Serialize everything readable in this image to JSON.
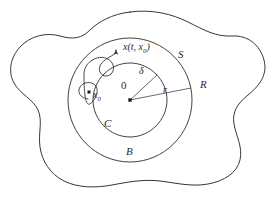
{
  "figure": {
    "background_color": "#ffffff",
    "stroke_color": "#2b2b2b",
    "line_width": 0.9
  },
  "labels": {
    "region_outer": "R",
    "circle_outer": "S",
    "annulus": "B",
    "circle_inner": "C",
    "radius_outer": "r",
    "radius_inner": "δ",
    "origin": "0",
    "initial_point": "x",
    "initial_point_sub": "0",
    "trajectory_prefix": "x(t, x",
    "trajectory_sub": "0",
    "trajectory_suffix": ")"
  },
  "geometry": {
    "center": {
      "x": 130,
      "y": 100
    },
    "inner_radius": 37,
    "outer_radius": 62,
    "origin_marker": {
      "x": 130,
      "y": 100,
      "size": 3.4
    },
    "initial_marker": {
      "x": 89,
      "y": 92,
      "size": 3.0
    },
    "delta_line": {
      "x1": 130,
      "y1": 100,
      "x2": 157,
      "y2": 75
    },
    "r_line": {
      "x1": 130,
      "y1": 100,
      "x2": 191,
      "y2": 88
    },
    "arrow_tip": {
      "x": 116,
      "y": 48
    }
  },
  "paths": {
    "region_boundary": "M 130 12 C 152 9 172 14 188 22 C 204 30 216 37 232 36 C 248 35 260 45 264 60 C 268 75 259 86 248 95 C 237 104 232 112 234 124 C 236 136 243 147 240 160 C 237 173 224 181 208 184 C 192 187 176 183 160 181 C 144 179 128 182 112 185 C 96 188 78 188 64 181 C 50 174 42 161 40 147 C 38 133 43 121 38 110 C 33 99 20 94 14 83 C 8 72 10 58 20 47 C 30 36 46 32 60 36 C 74 40 82 38 90 30 C 98 22 112 14 130 12 Z",
    "outer_circle": "M 130 38 C 164 38 192 66 192 100 C 192 134 164 162 130 162 C 96 162 68 134 68 100 C 68 66 96 38 130 38 Z",
    "inner_circle": "M 130 63 C 150 63 167 80 167 100 C 167 120 150 137 130 137 C 110 137 93 120 93 100 C 93 80 110 63 130 63 Z",
    "trajectory": "M 88 99 C 80 98 77 92 80 87 C 83 82 91 81 95 85 C 99 89 97 96 93 101 C 89 106 84 110 84 74 C 84 66 90 60 97 58 C 104 56 111 59 113 65 C 115 71 111 76 106 76 C 101 76 98 71 100 66 C 102 61 108 58 113 55 C 115 54 116 52 116 50"
  }
}
